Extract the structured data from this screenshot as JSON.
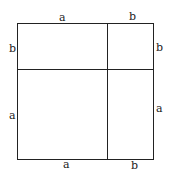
{
  "diagram": {
    "title": "",
    "labels": {
      "top_a": "a",
      "top_b": "b",
      "left_b": "b",
      "left_a": "a",
      "right_b": "b",
      "right_a": "a",
      "bottom_a": "a",
      "bottom_b": "b"
    },
    "colors": {
      "stroke": "#222222",
      "background": "#ffffff"
    }
  }
}
